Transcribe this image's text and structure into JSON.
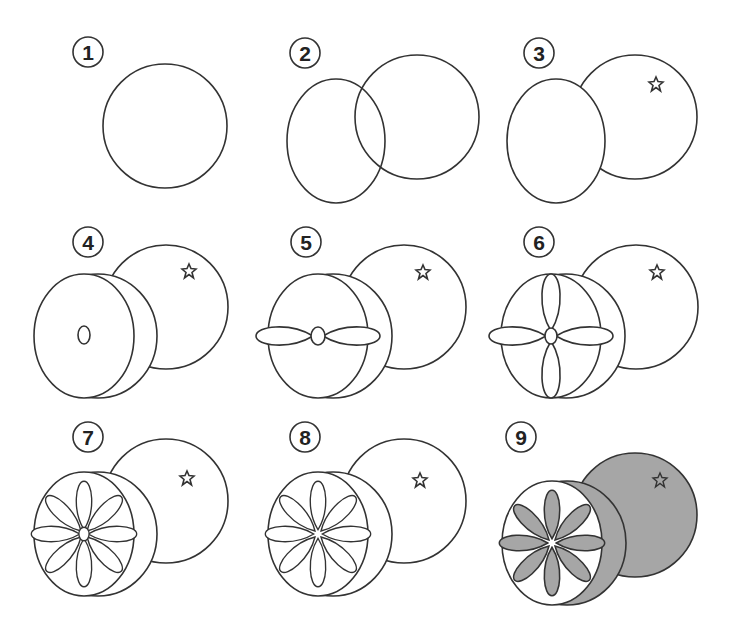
{
  "steps": [
    {
      "number": "1",
      "label": "Draw a circle"
    },
    {
      "number": "2",
      "label": "Add an overlapping oval"
    },
    {
      "number": "3",
      "label": "Erase overlap, add star stem"
    },
    {
      "number": "4",
      "label": "Add rind edge and center"
    },
    {
      "number": "5",
      "label": "Add two horizontal segments"
    },
    {
      "number": "6",
      "label": "Add two vertical segments"
    },
    {
      "number": "7",
      "label": "Add diagonal segments"
    },
    {
      "number": "8",
      "label": "Refine segments with star center"
    },
    {
      "number": "9",
      "label": "Color the orange"
    }
  ],
  "colors": {
    "line": "#333333",
    "fill": "#a6a6a6",
    "background": "#ffffff"
  }
}
